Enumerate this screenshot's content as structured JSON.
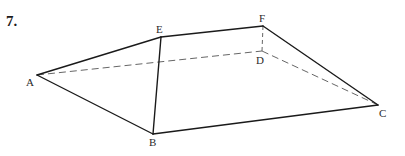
{
  "problem": {
    "number": "7."
  },
  "figure": {
    "type": "polyhedron-wireframe",
    "line_color": "#1a1a1a",
    "dashed_color": "#555555",
    "vertices": {
      "A": {
        "label": "A",
        "x": 37,
        "y": 75,
        "lx": 26,
        "ly": 86
      },
      "B": {
        "label": "B",
        "x": 153,
        "y": 134,
        "lx": 149,
        "ly": 146
      },
      "C": {
        "label": "C",
        "x": 378,
        "y": 105,
        "lx": 379,
        "ly": 117
      },
      "D": {
        "label": "D",
        "x": 262,
        "y": 51,
        "lx": 256,
        "ly": 64
      },
      "E": {
        "label": "E",
        "x": 161,
        "y": 37,
        "lx": 156,
        "ly": 33
      },
      "F": {
        "label": "F",
        "x": 263,
        "y": 26,
        "lx": 259,
        "ly": 22
      }
    },
    "solid_edges": [
      [
        "A",
        "E"
      ],
      [
        "E",
        "F"
      ],
      [
        "F",
        "C"
      ],
      [
        "A",
        "B"
      ],
      [
        "B",
        "C"
      ],
      [
        "E",
        "B"
      ]
    ],
    "dashed_edges": [
      [
        "A",
        "D"
      ],
      [
        "D",
        "C"
      ],
      [
        "F",
        "D"
      ]
    ]
  }
}
